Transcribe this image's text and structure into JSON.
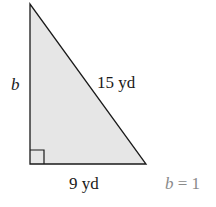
{
  "diagram": {
    "type": "right-triangle",
    "fill_color": "#e6e6e6",
    "stroke_color": "#1a1a1a",
    "labels": {
      "vertical_leg": "b",
      "hypotenuse": "15 yd",
      "horizontal_leg": "9 yd"
    },
    "right_angle_marker": true
  },
  "answer": {
    "var": "b",
    "eq": "= 1"
  }
}
